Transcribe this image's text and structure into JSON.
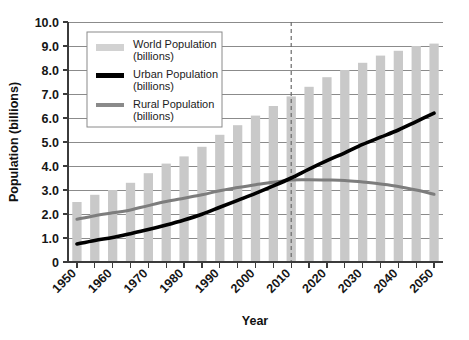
{
  "chart_data": {
    "type": "bar",
    "title": "",
    "xlabel": "Year",
    "ylabel": "Population (billions)",
    "xlim": [
      1950,
      2050
    ],
    "ylim": [
      0,
      10
    ],
    "y_ticks": [
      "0",
      "1.0",
      "2.0",
      "3.0",
      "4.0",
      "5.0",
      "6.0",
      "7.0",
      "8.0",
      "9.0",
      "10.0"
    ],
    "y_tick_values": [
      0,
      1,
      2,
      3,
      4,
      5,
      6,
      7,
      8,
      9,
      10
    ],
    "x_tick_labels": [
      "1950",
      "1960",
      "1970",
      "1980",
      "1990",
      "2000",
      "2010",
      "2020",
      "2030",
      "2040",
      "2050"
    ],
    "x_tick_values": [
      1950,
      1960,
      1970,
      1980,
      1990,
      2000,
      2010,
      2020,
      2030,
      2040,
      2050
    ],
    "categories": [
      1950,
      1955,
      1960,
      1965,
      1970,
      1975,
      1980,
      1985,
      1990,
      1995,
      2000,
      2005,
      2010,
      2015,
      2020,
      2025,
      2030,
      2035,
      2040,
      2045,
      2050
    ],
    "grid": true,
    "legend_position": "upper-left-inside",
    "annotations": [
      {
        "name": "present-day-divider",
        "type": "vline",
        "x": 2010,
        "style": "dashed"
      }
    ],
    "series": [
      {
        "name": "World Population (billions)",
        "render": "bar",
        "color": "#c9c9c9",
        "values": [
          2.5,
          2.8,
          3.0,
          3.3,
          3.7,
          4.1,
          4.4,
          4.8,
          5.3,
          5.7,
          6.1,
          6.5,
          6.9,
          7.3,
          7.7,
          8.0,
          8.3,
          8.6,
          8.8,
          9.0,
          9.1
        ]
      },
      {
        "name": "Urban Population (billions)",
        "render": "line",
        "color": "#000000",
        "values": [
          0.75,
          0.9,
          1.02,
          1.18,
          1.35,
          1.54,
          1.75,
          1.99,
          2.28,
          2.57,
          2.86,
          3.17,
          3.5,
          3.87,
          4.22,
          4.55,
          4.9,
          5.2,
          5.5,
          5.85,
          6.2
        ]
      },
      {
        "name": "Rural Population (billions)",
        "render": "line",
        "color": "#7d7d7d",
        "values": [
          1.78,
          1.93,
          2.05,
          2.17,
          2.35,
          2.52,
          2.66,
          2.8,
          2.97,
          3.1,
          3.22,
          3.32,
          3.42,
          3.43,
          3.42,
          3.4,
          3.33,
          3.25,
          3.15,
          3.0,
          2.82
        ]
      }
    ]
  },
  "legend": {
    "entries": [
      {
        "swatch": "world-swatch",
        "line1": "World Population",
        "line2": "(billions)"
      },
      {
        "swatch": "urban-swatch",
        "line1": "Urban Population",
        "line2": "(billions)"
      },
      {
        "swatch": "rural-swatch",
        "line1": "Rural Population",
        "line2": "(billions)"
      }
    ]
  },
  "axes": {
    "y_title": "Population (billions)",
    "x_title": "Year"
  }
}
